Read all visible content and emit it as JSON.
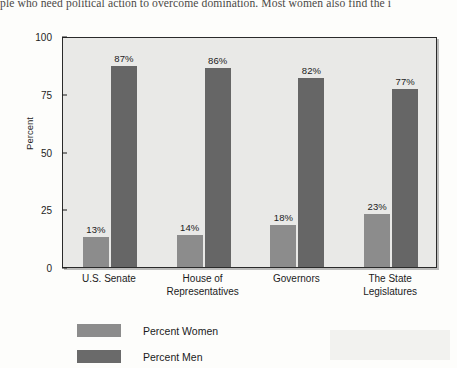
{
  "page": {
    "body_text_fragment": "ple who need political action to overcome domination. Most women also find the i"
  },
  "chart_data": {
    "type": "bar",
    "title": "",
    "xlabel": "",
    "ylabel": "Percent",
    "ylim": [
      0,
      100
    ],
    "yticks": [
      "0",
      "25",
      "50",
      "75",
      "100"
    ],
    "grid": false,
    "legend_position": "below-left",
    "categories": [
      "U.S. Senate",
      "House of Representatives",
      "Governors",
      "The State Legislatures"
    ],
    "categories_lines": [
      [
        "U.S. Senate"
      ],
      [
        "House of",
        "Representatives"
      ],
      [
        "Governors"
      ],
      [
        "The State",
        "Legislatures"
      ]
    ],
    "series": [
      {
        "name": "Percent Women",
        "color": "#8c8c8c",
        "values": [
          13,
          14,
          18,
          23
        ],
        "labels": [
          "13%",
          "14%",
          "18%",
          "23%"
        ]
      },
      {
        "name": "Percent Men",
        "color": "#666666",
        "values": [
          87,
          86,
          82,
          77
        ],
        "labels": [
          "87%",
          "86%",
          "82%",
          "77%"
        ]
      }
    ]
  },
  "legend": {
    "items": [
      {
        "label": "Percent Women",
        "swatch": "women"
      },
      {
        "label": "Percent Men",
        "swatch": "men"
      }
    ]
  }
}
